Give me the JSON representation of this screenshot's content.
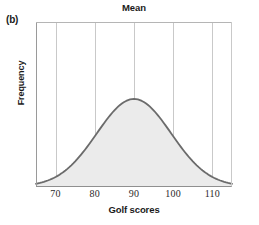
{
  "panel": {
    "label": "(b)"
  },
  "chart_data": {
    "type": "line",
    "title": "Mean",
    "xlabel": "Golf scores",
    "ylabel": "Frequency",
    "xlim": [
      65,
      115
    ],
    "ylim": [
      0,
      1
    ],
    "xticks": [
      70,
      80,
      90,
      100,
      110
    ],
    "xtick_labels": [
      "70",
      "80",
      "90",
      "100",
      "110"
    ],
    "ytick_labels": [],
    "grid": "vertical",
    "legend": "none",
    "annotations": [
      {
        "text": "Mean",
        "x": 90,
        "note": "title marks the mean of the distribution at x=90"
      }
    ],
    "series": [
      {
        "name": "Golf score distribution",
        "kind": "normal-curve",
        "mean": 90,
        "std": 9.5,
        "fill": "#ebebeb",
        "stroke": "#6b6b6b",
        "x": [
          65,
          67,
          69,
          70,
          72,
          74,
          76,
          78,
          80,
          82,
          84,
          86,
          88,
          90,
          92,
          94,
          96,
          98,
          100,
          102,
          104,
          106,
          108,
          110,
          112,
          114,
          115
        ],
        "y": [
          0.01,
          0.02,
          0.03,
          0.04,
          0.07,
          0.11,
          0.17,
          0.25,
          0.35,
          0.48,
          0.62,
          0.77,
          0.91,
          1.0,
          0.97,
          0.87,
          0.73,
          0.58,
          0.43,
          0.3,
          0.2,
          0.12,
          0.07,
          0.04,
          0.02,
          0.01,
          0.01
        ]
      }
    ]
  },
  "colors": {
    "curve_stroke": "#6b6b6b",
    "curve_fill": "#ebebeb",
    "gridline": "#c9c9c9",
    "axis": "#9a9a9a",
    "text": "#1a1a1a"
  }
}
